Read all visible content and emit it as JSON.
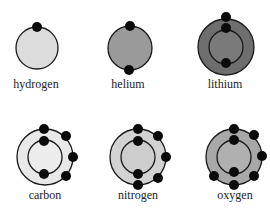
{
  "atoms": [
    {
      "name": "hydrogen",
      "label": "hydrogen",
      "cx": 37,
      "cy": 48,
      "outer_r": 21,
      "inner_r": null,
      "fill": "#dcdcdc",
      "inner_fill": null,
      "label_x": 36,
      "label_y": 88,
      "electrons": [
        [
          37,
          27
        ]
      ]
    },
    {
      "name": "helium",
      "label": "helium",
      "cx": 130,
      "cy": 48,
      "outer_r": 22,
      "inner_r": null,
      "fill": "#9a9a9a",
      "inner_fill": null,
      "label_x": 128,
      "label_y": 88,
      "electrons": [
        [
          130,
          26
        ],
        [
          129,
          70
        ]
      ]
    },
    {
      "name": "lithium",
      "label": "lithium",
      "cx": 226,
      "cy": 47,
      "outer_r": 28,
      "inner_r": 17,
      "fill": "#6e6e6e",
      "inner_fill": "#7a7a7a",
      "label_x": 225,
      "label_y": 88,
      "electrons": [
        [
          226,
          17
        ],
        [
          226,
          28
        ],
        [
          226,
          63
        ]
      ]
    },
    {
      "name": "carbon",
      "label": "carbon",
      "cx": 45,
      "cy": 157,
      "outer_r": 28,
      "inner_r": 17,
      "fill": "#e8e8e8",
      "inner_fill": "#ececec",
      "label_x": 45,
      "label_y": 199,
      "electrons": [
        [
          44,
          129
        ],
        [
          44,
          141
        ],
        [
          44,
          174
        ],
        [
          66,
          136
        ],
        [
          73,
          157
        ],
        [
          66,
          176
        ]
      ]
    },
    {
      "name": "nitrogen",
      "label": "nitrogen",
      "cx": 138,
      "cy": 157,
      "outer_r": 28,
      "inner_r": 17,
      "fill": "#d2d2d2",
      "inner_fill": "#cdcdcd",
      "label_x": 138,
      "label_y": 199,
      "electrons": [
        [
          138,
          129
        ],
        [
          138,
          141
        ],
        [
          138,
          174
        ],
        [
          158,
          136
        ],
        [
          166,
          157
        ],
        [
          158,
          178
        ],
        [
          138,
          185
        ]
      ]
    },
    {
      "name": "oxygen",
      "label": "oxygen",
      "cx": 234,
      "cy": 157,
      "outer_r": 28,
      "inner_r": 17,
      "fill": "#a8a8a8",
      "inner_fill": "#b0b0b0",
      "label_x": 235,
      "label_y": 199,
      "electrons": [
        [
          234,
          129
        ],
        [
          234,
          140
        ],
        [
          234,
          172
        ],
        [
          254,
          135
        ],
        [
          262,
          156
        ],
        [
          254,
          176
        ],
        [
          234,
          185
        ],
        [
          214,
          176
        ]
      ]
    }
  ],
  "style": {
    "stroke": "#1a1a1a",
    "electron_color": "#0a0a0a",
    "electron_r": 5
  }
}
